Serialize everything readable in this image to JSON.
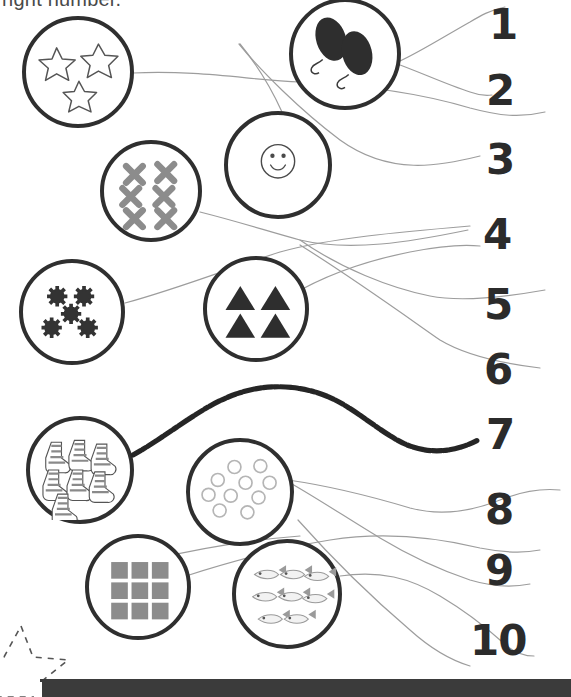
{
  "worksheet": {
    "instruction": "right number.",
    "title_visible_fragment": "right number."
  },
  "numbers": [
    {
      "label": "1",
      "x": 489,
      "y": 4
    },
    {
      "label": "2",
      "x": 486,
      "y": 70
    },
    {
      "label": "3",
      "x": 486,
      "y": 139
    },
    {
      "label": "4",
      "x": 483,
      "y": 214
    },
    {
      "label": "5",
      "x": 484,
      "y": 284
    },
    {
      "label": "6",
      "x": 484,
      "y": 349
    },
    {
      "label": "7",
      "x": 486,
      "y": 414
    },
    {
      "label": "8",
      "x": 485,
      "y": 489
    },
    {
      "label": "9",
      "x": 485,
      "y": 550
    },
    {
      "label": "10",
      "x": 470,
      "y": 620
    }
  ],
  "groups": [
    {
      "id": "stars",
      "icon": "star-outline-icon",
      "count": 3,
      "cx": 78,
      "cy": 72,
      "r": 56
    },
    {
      "id": "balloons",
      "icon": "balloon-icon",
      "count": 2,
      "cx": 345,
      "cy": 54,
      "r": 56
    },
    {
      "id": "smiley",
      "icon": "smiley-face-icon",
      "count": 1,
      "cx": 278,
      "cy": 165,
      "r": 54
    },
    {
      "id": "crosses",
      "icon": "cross-mark-icon",
      "count": 6,
      "cx": 151,
      "cy": 191,
      "r": 51
    },
    {
      "id": "snowflakes",
      "icon": "snowflake-icon",
      "count": 5,
      "cx": 72,
      "cy": 312,
      "r": 53
    },
    {
      "id": "triangles",
      "icon": "triangle-icon",
      "count": 4,
      "cx": 256,
      "cy": 309,
      "r": 53
    },
    {
      "id": "socks",
      "icon": "sock-icon",
      "count": 7,
      "cx": 80,
      "cy": 470,
      "r": 54
    },
    {
      "id": "rings",
      "icon": "ring-outline-icon",
      "count": 10,
      "cx": 240,
      "cy": 492,
      "r": 54
    },
    {
      "id": "squares",
      "icon": "square-icon",
      "count": 9,
      "cx": 138,
      "cy": 587,
      "r": 53
    },
    {
      "id": "fish",
      "icon": "fish-icon",
      "count": 8,
      "cx": 287,
      "cy": 594,
      "r": 55
    }
  ],
  "decorations": {
    "dashed_star": "dashed-star-outline-icon",
    "bottom_bar": "page-footer-bar"
  },
  "colors": {
    "circle_outline": "#2f2f2f",
    "number_text": "#2b2b2b",
    "pencil_line": "#9a9a9a",
    "heavy_line": "#262626",
    "filled_shape": "#3a3a3a",
    "gray_shape": "#8c8c8c",
    "footer_bar": "#3b3b3b",
    "page_background": "#ffffff"
  }
}
